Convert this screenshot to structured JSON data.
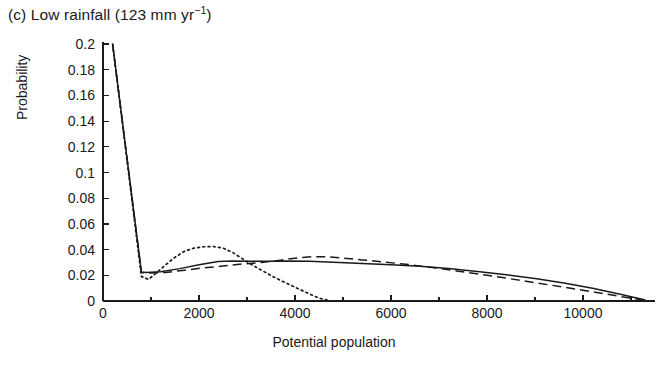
{
  "figure": {
    "panel_label": "(c)",
    "title_text": "(c) Low rainfall (123 mm yr",
    "title_sup": "−1",
    "title_tail": ")",
    "title_full": "(c) Low rainfall (123 mm yr−1)",
    "background_color": "#ffffff",
    "line_color": "#1a1a1a"
  },
  "chart_data": {
    "type": "line",
    "title": "(c) Low rainfall (123 mm yr−1)",
    "xlabel": "Potential population",
    "ylabel": "Probability",
    "xlim": [
      0,
      11500
    ],
    "ylim": [
      0,
      0.2
    ],
    "grid": false,
    "legend_position": "none",
    "xticks": [
      0,
      2000,
      4000,
      6000,
      8000,
      10000
    ],
    "xticklabels": [
      "0",
      "2000",
      "4000",
      "6000",
      "8000",
      "10000"
    ],
    "xminor_tick_step": 1000,
    "yticks": [
      0,
      0.02,
      0.04,
      0.06,
      0.08,
      0.1,
      0.12,
      0.14,
      0.16,
      0.18,
      0.2
    ],
    "yticklabels": [
      "0",
      "0.02",
      "0.04",
      "0.06",
      "0.08",
      "0.1",
      "0.12",
      "0.14",
      "0.16",
      "0.18",
      "0.2"
    ],
    "series": [
      {
        "name": "solid",
        "style": "solid",
        "x": [
          200,
          800,
          900,
          1200,
          1600,
          2000,
          2400,
          2700,
          3000,
          3400,
          3800,
          4300,
          4800,
          5400,
          6000,
          6600,
          7200,
          7800,
          8400,
          9000,
          9600,
          10200,
          10800,
          11300
        ],
        "values": [
          0.2,
          0.0225,
          0.0222,
          0.0228,
          0.0252,
          0.0282,
          0.0308,
          0.0312,
          0.031,
          0.031,
          0.0312,
          0.031,
          0.0302,
          0.0292,
          0.0282,
          0.027,
          0.0252,
          0.023,
          0.0205,
          0.0175,
          0.014,
          0.01,
          0.005,
          0.0008
        ]
      },
      {
        "name": "dashed",
        "style": "dashed",
        "x": [
          200,
          800,
          900,
          1300,
          1700,
          2100,
          2500,
          2900,
          3300,
          3700,
          4100,
          4400,
          4700,
          5000,
          5400,
          5900,
          6400,
          6900,
          7400,
          7900,
          8400,
          9000,
          9600,
          10200,
          10800,
          11300
        ],
        "values": [
          0.2,
          0.0222,
          0.0218,
          0.0222,
          0.024,
          0.0258,
          0.0272,
          0.0288,
          0.03,
          0.0318,
          0.0338,
          0.0345,
          0.0343,
          0.0334,
          0.032,
          0.0302,
          0.0282,
          0.0258,
          0.0232,
          0.0205,
          0.0178,
          0.0142,
          0.0108,
          0.0072,
          0.0034,
          0.0005
        ]
      },
      {
        "name": "dotted",
        "style": "dotted",
        "x": [
          200,
          800,
          950,
          1100,
          1300,
          1500,
          1700,
          1900,
          2100,
          2300,
          2500,
          2700,
          2900,
          3100,
          3300,
          3500,
          3700,
          3900,
          4100,
          4300,
          4500,
          4700
        ],
        "values": [
          0.2,
          0.019,
          0.0168,
          0.0215,
          0.028,
          0.034,
          0.0388,
          0.0412,
          0.0422,
          0.0424,
          0.0412,
          0.0378,
          0.033,
          0.0282,
          0.024,
          0.0198,
          0.016,
          0.0125,
          0.009,
          0.0055,
          0.0022,
          0.0005
        ]
      }
    ]
  },
  "axes": {
    "x_axis_label": "Potential population",
    "y_axis_label": "Probability"
  }
}
